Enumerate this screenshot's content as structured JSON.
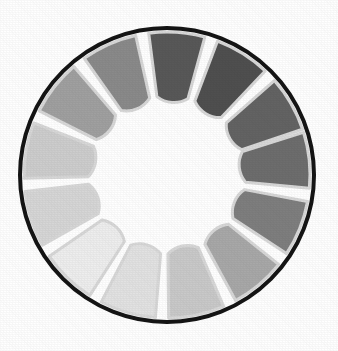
{
  "figure": {
    "kind": "radial-step-wedge",
    "background_color": "#ffffff"
  },
  "disc": {
    "center_x": 167,
    "center_y": 175,
    "outer_radius": 149,
    "border_color": "#141414",
    "border_width": 4,
    "face_color": "#ffffff"
  },
  "hub": {
    "label": "center hub",
    "radius": 57,
    "color": "#ffffff"
  },
  "separators": {
    "color": "#d8d8d8",
    "width": 3
  },
  "segments": {
    "count": 13,
    "inner_radius": 57,
    "outer_radius": 143,
    "tip_radius": 22,
    "gap_degrees": 5,
    "items": [
      {
        "index": 1,
        "label": "step-1",
        "center_angle": -6,
        "gray": "#6d6d6d",
        "value": 43
      },
      {
        "index": 2,
        "label": "step-2",
        "center_angle": 22,
        "gray": "#7e7e7e",
        "value": 49
      },
      {
        "index": 3,
        "label": "step-3",
        "center_angle": 50,
        "gray": "#a8a8a8",
        "value": 66
      },
      {
        "index": 4,
        "label": "step-4",
        "center_angle": 78,
        "gray": "#c9c9c9",
        "value": 79
      },
      {
        "index": 5,
        "label": "step-5",
        "center_angle": 106,
        "gray": "#e2e2e2",
        "value": 89
      },
      {
        "index": 6,
        "label": "step-6",
        "center_angle": 134,
        "gray": "#eeeeee",
        "value": 93
      },
      {
        "index": 7,
        "label": "step-7",
        "center_angle": 162,
        "gray": "#d6d6d6",
        "value": 84
      },
      {
        "index": 8,
        "label": "step-8",
        "center_angle": 190,
        "gray": "#cdcdcd",
        "value": 80
      },
      {
        "index": 9,
        "label": "step-9",
        "center_angle": 218,
        "gray": "#a0a0a0",
        "value": 63
      },
      {
        "index": 10,
        "label": "step-10",
        "center_angle": 246,
        "gray": "#8a8a8a",
        "value": 54
      },
      {
        "index": 11,
        "label": "step-11",
        "center_angle": 274,
        "gray": "#585858",
        "value": 35
      },
      {
        "index": 12,
        "label": "step-12",
        "center_angle": 302,
        "gray": "#4f4f4f",
        "value": 31
      },
      {
        "index": 13,
        "label": "step-13",
        "center_angle": 330,
        "gray": "#636363",
        "value": 39
      }
    ]
  }
}
